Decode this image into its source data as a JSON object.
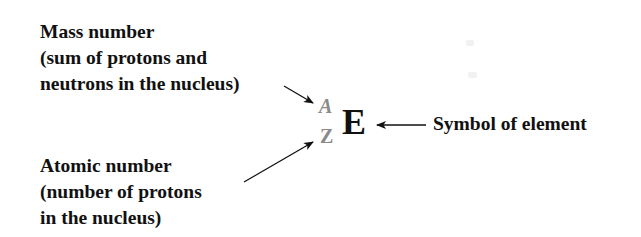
{
  "diagram": {
    "notation": {
      "mass_number": "A",
      "atomic_number": "Z",
      "symbol": "E"
    },
    "labels": {
      "mass_number": {
        "lines": [
          "Mass number",
          "(sum of protons and",
          "neutrons in the nucleus)"
        ]
      },
      "atomic_number": {
        "lines": [
          "Atomic number",
          "(number of protons",
          "in the nucleus)"
        ]
      },
      "symbol": {
        "text": "Symbol of element"
      }
    },
    "colors": {
      "text": "#111111",
      "superscript_subscript": "#8a8a8a",
      "arrow": "#111111",
      "background": "#ffffff"
    }
  }
}
